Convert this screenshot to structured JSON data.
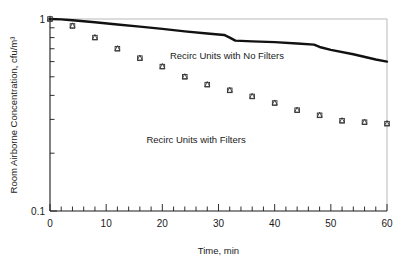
{
  "chart_data": {
    "type": "scatter",
    "title": "",
    "xlabel": "Time, min",
    "ylabel": "Room Airborne Concentration, cfu/m³",
    "xlim": [
      0,
      60
    ],
    "ylim": [
      0.1,
      1
    ],
    "yscale": "log",
    "xscale": "linear",
    "grid": false,
    "legend_position": "inline-annotation",
    "x_ticks_major": [
      0,
      10,
      20,
      30,
      40,
      50,
      60
    ],
    "x_tick_labels": [
      "0",
      "10",
      "20",
      "30",
      "40",
      "50",
      "60"
    ],
    "x_tick_minor_step": 2,
    "y_ticks_major": [
      0.1,
      1
    ],
    "y_tick_labels": [
      "0.1",
      "1"
    ],
    "y_minor_ticks": [
      0.9,
      0.8,
      0.7,
      0.6,
      0.5,
      0.4,
      0.3,
      0.2
    ],
    "series": [
      {
        "name": "Recirc Units with No Filters",
        "render": "line",
        "marker": "none",
        "color": "#111111",
        "x": [
          0,
          2,
          4,
          8,
          12,
          16,
          20,
          24,
          28,
          31,
          32,
          33,
          36,
          40,
          44,
          47,
          48,
          50,
          54,
          58,
          60
        ],
        "values": [
          1.0,
          0.995,
          0.985,
          0.962,
          0.936,
          0.912,
          0.888,
          0.862,
          0.84,
          0.826,
          0.8,
          0.772,
          0.765,
          0.758,
          0.745,
          0.735,
          0.715,
          0.69,
          0.655,
          0.615,
          0.6
        ]
      },
      {
        "name": "Recirc Units with Filters",
        "render": "markers",
        "marker": "square+triangle",
        "color": "#333333",
        "x": [
          0,
          4,
          8,
          12,
          16,
          20,
          24,
          28,
          32,
          36,
          40,
          44,
          48,
          52,
          56,
          60
        ],
        "values": [
          1.0,
          0.92,
          0.8,
          0.7,
          0.625,
          0.565,
          0.5,
          0.455,
          0.425,
          0.395,
          0.365,
          0.335,
          0.315,
          0.295,
          0.29,
          0.285
        ]
      }
    ],
    "annotations": [
      {
        "text": "Recirc Units with No Filters",
        "x": 31.5,
        "y": 0.62
      },
      {
        "text": "Recirc Units with Filters",
        "x": 26.0,
        "y": 0.225
      }
    ]
  },
  "axes": {
    "x_axis_name": "time-axis",
    "y_axis_name": "concentration-axis"
  }
}
